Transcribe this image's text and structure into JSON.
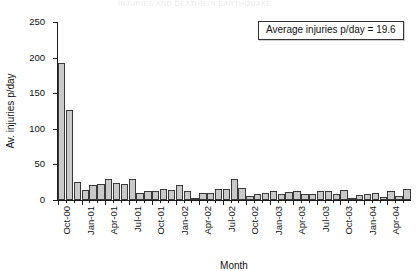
{
  "page": {
    "header_remnant": "INJURIES AND DEATHS IN EARTHQUAKE",
    "folio": "41"
  },
  "annotation": {
    "text": "Average injuries p/day = 19.6",
    "value": 19.6
  },
  "chart_data": {
    "type": "bar",
    "title": "",
    "xlabel": "Month",
    "ylabel": "Av. injuries p/day",
    "ylim": [
      0,
      250
    ],
    "yticks": [
      0,
      50,
      100,
      150,
      200,
      250
    ],
    "grid": false,
    "legend": "none",
    "bar_color": "#c9c9c9",
    "bar_edge_color": "#3a3a3a",
    "tick_label_interval_months": 3,
    "tick_labels": [
      "Oct-00",
      "Jan-01",
      "Apr-01",
      "Jul-01",
      "Oct-01",
      "Jan-02",
      "Apr-02",
      "Jul-02",
      "Oct-02",
      "Jan-03",
      "Apr-03",
      "Jul-03",
      "Oct-03",
      "Jan-04",
      "Apr-04"
    ],
    "categories": [
      "Oct-00",
      "Nov-00",
      "Dec-00",
      "Jan-01",
      "Feb-01",
      "Mar-01",
      "Apr-01",
      "May-01",
      "Jun-01",
      "Jul-01",
      "Aug-01",
      "Sep-01",
      "Oct-01",
      "Nov-01",
      "Dec-01",
      "Jan-02",
      "Feb-02",
      "Mar-02",
      "Apr-02",
      "May-02",
      "Jun-02",
      "Jul-02",
      "Aug-02",
      "Sep-02",
      "Oct-02",
      "Nov-02",
      "Dec-02",
      "Jan-03",
      "Feb-03",
      "Mar-03",
      "Apr-03",
      "May-03",
      "Jun-03",
      "Jul-03",
      "Aug-03",
      "Sep-03",
      "Oct-03",
      "Nov-03",
      "Dec-03",
      "Jan-04",
      "Feb-04",
      "Mar-04",
      "Apr-04",
      "May-04",
      "Jun-04"
    ],
    "values": [
      192,
      127,
      25,
      14,
      21,
      22,
      30,
      24,
      23,
      30,
      10,
      12,
      13,
      15,
      14,
      21,
      13,
      3,
      10,
      10,
      15,
      16,
      30,
      17,
      5,
      9,
      10,
      12,
      8,
      11,
      13,
      8,
      9,
      12,
      13,
      8,
      14,
      3,
      7,
      9,
      10,
      4,
      12,
      6,
      16
    ]
  }
}
